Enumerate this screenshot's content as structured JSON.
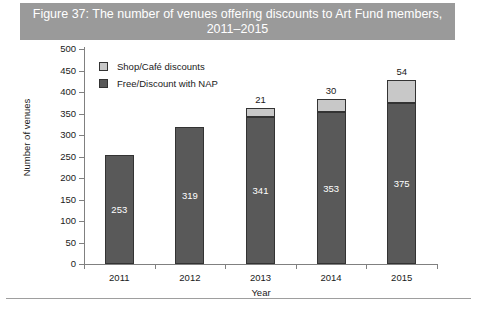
{
  "figure": {
    "title": "Figure 37: The number of venues offering discounts to Art Fund members, 2011–2015",
    "title_band_color": "#9a9a9a",
    "title_text_color": "#ffffff"
  },
  "chart_data": {
    "type": "bar",
    "subtype": "stacked",
    "title": "Figure 37: The number of venues offering discounts to Art Fund members, 2011–2015",
    "xlabel": "Year",
    "ylabel": "Number of venues",
    "categories": [
      "2011",
      "2012",
      "2013",
      "2014",
      "2015"
    ],
    "series": [
      {
        "name": "Free/Discount with NAP",
        "color": "#595959",
        "values": [
          253,
          319,
          341,
          353,
          375
        ],
        "label_color": "#ffffff",
        "labels": [
          "253",
          "319",
          "341",
          "353",
          "375"
        ]
      },
      {
        "name": "Shop/Café discounts",
        "color": "#c8c8c8",
        "values": [
          0,
          0,
          21,
          30,
          54
        ],
        "label_color": "#1a1a1a",
        "labels": [
          "",
          "",
          "21",
          "30",
          "54"
        ]
      }
    ],
    "totals": [
      253,
      319,
      362,
      383,
      429
    ],
    "ylim": [
      0,
      500
    ],
    "ytick_step": 50,
    "yticks": [
      0,
      50,
      100,
      150,
      200,
      250,
      300,
      350,
      400,
      450,
      500
    ],
    "ytick_labels": [
      "0",
      "50",
      "100",
      "150",
      "200",
      "250",
      "300",
      "350",
      "400",
      "450",
      "500"
    ],
    "grid": false,
    "legend_position": "upper-left-inside",
    "legend_entries": [
      "Shop/Café discounts",
      "Free/Discount with NAP"
    ]
  }
}
